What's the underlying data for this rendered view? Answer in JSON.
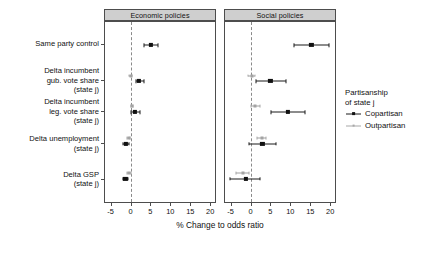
{
  "chart_data": {
    "type": "scatter",
    "plot_kind": "coefficient-forest-plot",
    "title": "",
    "xlabel": "% Change to odds ratio",
    "ylabel": "",
    "xlim": [
      -6.4,
      21.2
    ],
    "xticks": [
      -5,
      0,
      5,
      10,
      15,
      20
    ],
    "xticklabels": [
      "-5",
      "0",
      "5",
      "10",
      "15",
      "20"
    ],
    "grid": false,
    "reference_line": 0,
    "legend": {
      "position": "right",
      "title_line1": "Partisanship",
      "title_line2": "of state j",
      "entries": [
        {
          "name": "Copartisan",
          "color": "#111111"
        },
        {
          "name": "Outpartisan",
          "color": "#a8a8a8"
        }
      ]
    },
    "facets": [
      {
        "label": "Economic policies"
      },
      {
        "label": "Social policies"
      }
    ],
    "categories": [
      "Same party control",
      "Delta incumbent gub. vote share (state j)",
      "Delta incumbent leg. vote share (state j)",
      "Delta unemployment (state j)",
      "Delta GSP (state j)"
    ],
    "category_label_lines": [
      [
        "Same party control"
      ],
      [
        "Delta incumbent",
        "gub. vote share",
        "(state j)"
      ],
      [
        "Delta incumbent",
        "leg. vote share",
        "(state j)"
      ],
      [
        "Delta unemployment",
        "(state j)"
      ],
      [
        "Delta GSP",
        "(state j)"
      ]
    ],
    "panels": [
      {
        "facet": "Economic policies",
        "series": [
          {
            "name": "Copartisan",
            "points": [
              {
                "category": "Same party control",
                "estimate": 5.2,
                "low": 3.5,
                "high": 7.0
              },
              {
                "category": "Delta incumbent gub. vote share (state j)",
                "estimate": 2.2,
                "low": 1.3,
                "high": 3.5
              },
              {
                "category": "Delta incumbent leg. vote share (state j)",
                "estimate": 1.1,
                "low": 0.2,
                "high": 2.3
              },
              {
                "category": "Delta unemployment (state j)",
                "estimate": -1.2,
                "low": -1.9,
                "high": -0.5
              },
              {
                "category": "Delta GSP (state j)",
                "estimate": -1.3,
                "low": -1.9,
                "high": -0.6
              }
            ]
          },
          {
            "name": "Outpartisan",
            "points": [
              {
                "category": "Delta incumbent gub. vote share (state j)",
                "estimate": 0.0,
                "low": -0.35,
                "high": 0.35
              },
              {
                "category": "Delta incumbent leg. vote share (state j)",
                "estimate": 0.35,
                "low": 0.1,
                "high": 0.7
              },
              {
                "category": "Delta unemployment (state j)",
                "estimate": -0.45,
                "low": -0.8,
                "high": -0.1
              },
              {
                "category": "Delta GSP (state j)",
                "estimate": -0.4,
                "low": -0.8,
                "high": 0.1
              }
            ]
          }
        ]
      },
      {
        "facet": "Social policies",
        "series": [
          {
            "name": "Copartisan",
            "points": [
              {
                "category": "Same party control",
                "estimate": 15.3,
                "low": 11.0,
                "high": 19.6
              },
              {
                "category": "Delta incumbent gub. vote share (state j)",
                "estimate": 5.0,
                "low": 1.5,
                "high": 8.8
              },
              {
                "category": "Delta incumbent leg. vote share (state j)",
                "estimate": 9.4,
                "low": 5.2,
                "high": 13.6
              },
              {
                "category": "Delta unemployment (state j)",
                "estimate": 3.0,
                "low": -0.3,
                "high": 6.4
              },
              {
                "category": "Delta GSP (state j)",
                "estimate": -1.2,
                "low": -5.2,
                "high": 2.5
              }
            ]
          },
          {
            "name": "Outpartisan",
            "points": [
              {
                "category": "Delta incumbent gub. vote share (state j)",
                "estimate": 0.3,
                "low": -0.6,
                "high": 1.1
              },
              {
                "category": "Delta incumbent leg. vote share (state j)",
                "estimate": 1.2,
                "low": 0.0,
                "high": 2.4
              },
              {
                "category": "Delta unemployment (state j)",
                "estimate": 2.8,
                "low": 1.7,
                "high": 3.8
              },
              {
                "category": "Delta GSP (state j)",
                "estimate": -2.0,
                "low": -3.6,
                "high": -0.5
              }
            ]
          }
        ]
      }
    ]
  }
}
